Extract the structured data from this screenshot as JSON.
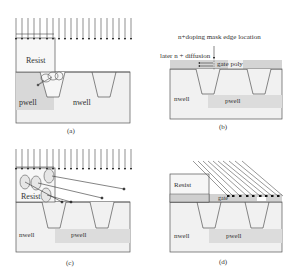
{
  "panels": [
    {
      "id": "a",
      "caption": "(a)",
      "labels": {
        "resist": "Resist",
        "left_well": "pwell",
        "right_well": "nwell"
      },
      "arrows": "vertical implant arrows"
    },
    {
      "id": "b",
      "caption": "(b)",
      "labels": {
        "mask_edge": "n+doping mask edge location",
        "diffusion": "later n + diffusion",
        "gate": "gate poly",
        "left_well": "nwell",
        "right_well": "pwell"
      }
    },
    {
      "id": "c",
      "caption": "(c)",
      "labels": {
        "resist": "Resist",
        "left_well": "nwell",
        "right_well": "pwell"
      },
      "arrows": "vertical implant arrows with scattered ions"
    },
    {
      "id": "d",
      "caption": "(d)",
      "labels": {
        "resist": "Resist",
        "gate": "gate",
        "left_well": "nwell",
        "right_well": "pwell"
      },
      "arrows": "tilted implant lines"
    }
  ],
  "colors": {
    "substrate": "#f1f1f1",
    "well_shade": "#dcdcdc",
    "resist_fill": "#f6f6f6",
    "gate_fill": "#d2d2d2",
    "line": "#444444"
  }
}
